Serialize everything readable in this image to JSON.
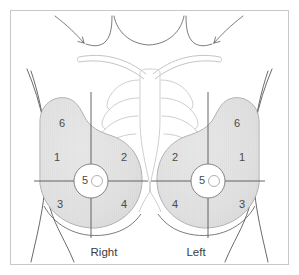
{
  "figure": {
    "frame_border_color": "#c8c8c8",
    "background_color": "#ffffff"
  },
  "colors": {
    "breast_fill": "#e2e2e2",
    "breast_outline": "#9a9a9a",
    "body_outline": "#5a5a5a",
    "rib_outline": "#cfcfcf",
    "clavicle_outline": "#c4c4c4",
    "quadrant_line": "#555555",
    "number_text": "#4a4a4a",
    "label_text": "#3c3c3c",
    "areola_fill": "#ffffff",
    "nipple_outline": "#b0b0b0"
  },
  "breasts": {
    "right": {
      "side_label": "Right",
      "regions": [
        {
          "id": "r1",
          "number": "1",
          "zone": "upper-outer-quadrant",
          "x": 57,
          "y": 158
        },
        {
          "id": "r2",
          "number": "2",
          "zone": "upper-inner-quadrant",
          "x": 124,
          "y": 158
        },
        {
          "id": "r3",
          "number": "3",
          "zone": "lower-outer-quadrant",
          "x": 60,
          "y": 205
        },
        {
          "id": "r4",
          "number": "4",
          "zone": "lower-inner-quadrant",
          "x": 124,
          "y": 205
        },
        {
          "id": "r5",
          "number": "5",
          "zone": "nipple-areola",
          "x": 91,
          "y": 181
        },
        {
          "id": "r6",
          "number": "6",
          "zone": "axillary-tail",
          "x": 62,
          "y": 124
        }
      ]
    },
    "left": {
      "side_label": "Left",
      "regions": [
        {
          "id": "l2",
          "number": "2",
          "zone": "upper-inner-quadrant",
          "x": 175,
          "y": 158
        },
        {
          "id": "l1",
          "number": "1",
          "zone": "upper-outer-quadrant",
          "x": 242,
          "y": 158
        },
        {
          "id": "l4",
          "number": "4",
          "zone": "lower-inner-quadrant",
          "x": 175,
          "y": 205
        },
        {
          "id": "l3",
          "number": "3",
          "zone": "lower-outer-quadrant",
          "x": 242,
          "y": 205
        },
        {
          "id": "l5",
          "number": "5",
          "zone": "nipple-areola",
          "x": 208,
          "y": 181
        },
        {
          "id": "l6",
          "number": "6",
          "zone": "axillary-tail",
          "x": 237,
          "y": 124
        }
      ]
    }
  },
  "labels": {
    "right_position": {
      "x": 104,
      "y": 253
    },
    "left_position": {
      "x": 196,
      "y": 253
    }
  },
  "anatomy": {
    "rib_pairs": 5,
    "has_sternum": true,
    "has_clavicles": true,
    "has_neck_outline": true,
    "has_shoulder_arrows": true
  }
}
